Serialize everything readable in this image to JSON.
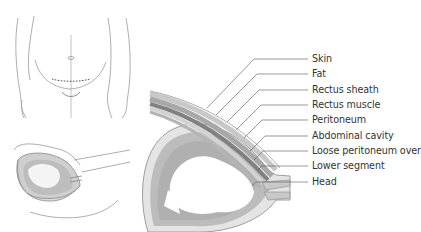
{
  "figure": {
    "panels": [
      {
        "id": "front-view",
        "description": "Front view of pregnant abdomen with low transverse incision line"
      },
      {
        "id": "side-view",
        "description": "Sagittal view of uterus and fetus"
      },
      {
        "id": "detail-view",
        "description": "Enlarged cross-section of abdominal wall layers over the uterus"
      }
    ],
    "labels": [
      {
        "text": "Skin",
        "y": 53
      },
      {
        "text": "Fat",
        "y": 68
      },
      {
        "text": "Rectus sheath",
        "y": 84
      },
      {
        "text": "Rectus muscle",
        "y": 99
      },
      {
        "text": "Peritoneum",
        "y": 114
      },
      {
        "text": "Abdominal cavity",
        "y": 130
      },
      {
        "text": "Loose peritoneum over",
        "y": 145
      },
      {
        "text": "Lower segment",
        "y": 160
      },
      {
        "text": "Head",
        "y": 176
      }
    ]
  },
  "colors": {
    "line": "#8a8a8a",
    "layer_dark": "#7d7d7d",
    "layer_mid": "#a9a9a9",
    "layer_light": "#d4d4d4",
    "fluid": "#b8b8b8",
    "text": "#333333"
  }
}
